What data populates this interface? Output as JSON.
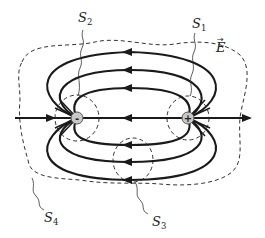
{
  "figure": {
    "charges": [
      {
        "id": "negative",
        "sign": "-",
        "x": 77,
        "y": 118
      },
      {
        "id": "positive",
        "sign": "+",
        "x": 188,
        "y": 118
      }
    ],
    "labels": {
      "s1": {
        "main": "S",
        "sub": "1"
      },
      "s2": {
        "main": "S",
        "sub": "2"
      },
      "s3": {
        "main": "S",
        "sub": "3"
      },
      "s4": {
        "main": "S",
        "sub": "4"
      },
      "field": {
        "main": "E",
        "vector_mark": "→"
      }
    },
    "colors": {
      "line": "#1a1a1a",
      "surface": "#333333",
      "charge_fill": "#c8c8c8",
      "background": "#ffffff"
    }
  }
}
